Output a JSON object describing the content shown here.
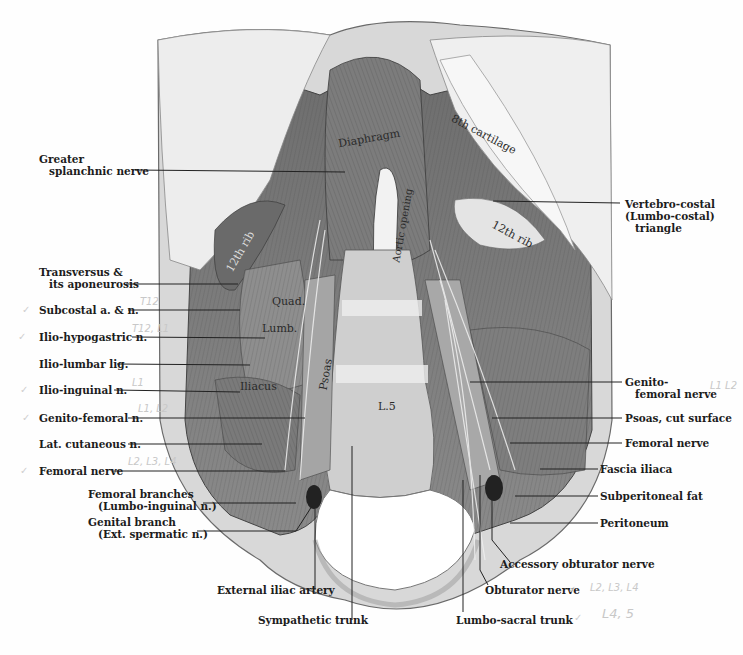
{
  "figure": {
    "inline_labels": {
      "diaphragm": "Diaphragm",
      "aortic_opening": "Aortic opening",
      "eighth_cartilage": "8th cartilage",
      "twelfth_rib_left": "12th rib",
      "twelfth_rib_right": "12th rib",
      "quad_lumb": "Quad.",
      "quad_lumb2": "Lumb.",
      "iliacus": "Iliacus",
      "psoas": "Psoas",
      "l5": "L.5"
    },
    "left_labels": [
      {
        "id": "greater-splanchnic",
        "line1": "Greater",
        "line2": "splanchnic nerve"
      },
      {
        "id": "transversus",
        "line1": "Transversus &",
        "line2": "its aponeurosis"
      },
      {
        "id": "subcostal",
        "line1": "Subcostal a. & n."
      },
      {
        "id": "ilio-hypogastric",
        "line1": "Ilio-hypogastric n."
      },
      {
        "id": "ilio-lumbar",
        "line1": "Ilio-lumbar lig."
      },
      {
        "id": "ilio-inguinal",
        "line1": "Ilio-inguinal n."
      },
      {
        "id": "genito-femoral-left",
        "line1": "Genito-femoral n."
      },
      {
        "id": "lat-cutaneous",
        "line1": "Lat. cutaneous n."
      },
      {
        "id": "femoral-left",
        "line1": "Femoral nerve"
      },
      {
        "id": "femoral-branches",
        "line1": "Femoral branches",
        "line2": "(Lumbo-inguinal n.)"
      },
      {
        "id": "genital-branch",
        "line1": "Genital branch",
        "line2": "(Ext. spermatic n.)"
      }
    ],
    "right_labels": [
      {
        "id": "vertebro-costal",
        "line1": "Vertebro-costal",
        "line2": "(Lumbo-costal)",
        "line3": "triangle"
      },
      {
        "id": "genito-femoral-right",
        "line1": "Genito-",
        "line2": "femoral nerve"
      },
      {
        "id": "psoas-cut",
        "line1": "Psoas, cut surface"
      },
      {
        "id": "femoral-right",
        "line1": "Femoral nerve"
      },
      {
        "id": "fascia-iliaca",
        "line1": "Fascia iliaca"
      },
      {
        "id": "subperitoneal-fat",
        "line1": "Subperitoneal fat"
      },
      {
        "id": "peritoneum",
        "line1": "Peritoneum"
      }
    ],
    "bottom_labels": {
      "external_iliac": "External iliac artery",
      "sympathetic_trunk": "Sympathetic trunk",
      "lumbo_sacral_trunk": "Lumbo-sacral trunk",
      "obturator": "Obturator nerve",
      "accessory_obturator": "Accessory obturator nerve"
    },
    "handwritten_notes": {
      "subcostal": "T12",
      "ilio_hypogastric": "T12, L1",
      "ilio_inguinal": "L1",
      "genito_femoral": "L1, L2",
      "femoral": "L2, L3, L4",
      "genito_femoral_right": "L1 L2",
      "obturator": "L2, L3, L4",
      "lumbo_sacral": "L4, 5"
    },
    "check_mark": "✓",
    "colors": {
      "ink": "#1c1c1c",
      "art_dark": "#5a5a5a",
      "art_mid": "#9a9a9a",
      "art_light": "#e2e2e2",
      "pencil": "#c8c8c8"
    }
  }
}
